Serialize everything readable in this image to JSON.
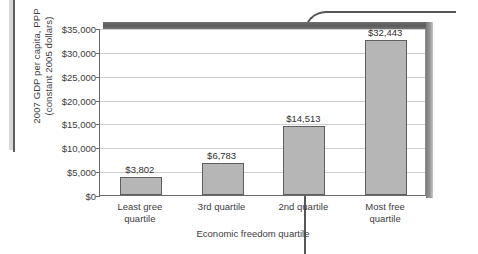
{
  "chart_data": {
    "type": "bar",
    "title": "",
    "xlabel": "Economic freedom quartile",
    "ylabel": "2007 GDP per capita, PPP\n(constant 2005 dollars)",
    "categories": [
      "Least gree\nquartile",
      "3rd quartile",
      "2nd quartile",
      "Most free\nquartile"
    ],
    "values": [
      3802,
      6783,
      14513,
      32443
    ],
    "value_labels": [
      "$3,802",
      "$6,783",
      "$14,513",
      "$32,443"
    ],
    "ylim": [
      0,
      35000
    ],
    "ytick_values": [
      0,
      5000,
      10000,
      15000,
      20000,
      25000,
      30000,
      35000
    ],
    "ytick_labels": [
      "$0",
      "$5,000",
      "$10,000",
      "$15,000",
      "$20,000",
      "$25,000",
      "$30,000",
      "$35,000"
    ],
    "grid": true,
    "legend": false,
    "legend_position": "none",
    "colors": {
      "bar_fill": "#b6b6b6",
      "bar_stroke": "#5e5e5e",
      "gridline": "#cfcfcf",
      "axis": "#6a6a6a",
      "text": "#3d3d3d",
      "plot_background": "#ffffff",
      "band_3d": "#5a5a5a"
    }
  }
}
